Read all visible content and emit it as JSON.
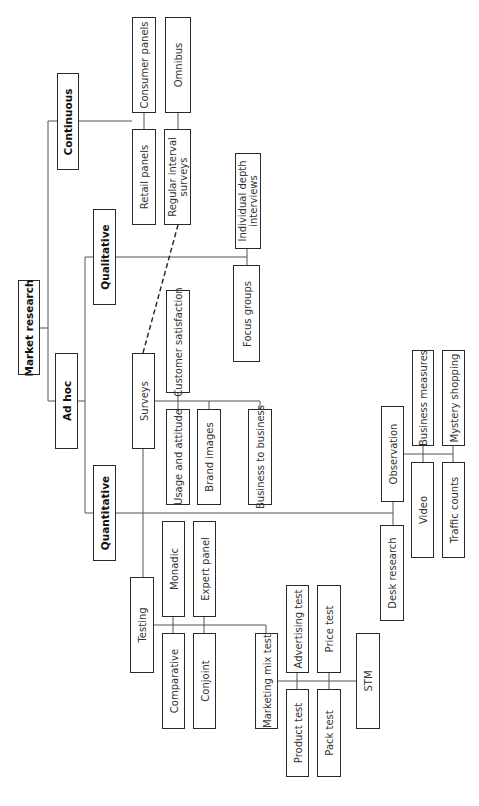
{
  "diagram": {
    "title": "Market research",
    "nodes": [
      {
        "id": "market-research",
        "label": "Market research",
        "bold": true,
        "x": 18,
        "y": 280,
        "w": 22,
        "h": 95
      },
      {
        "id": "continuous",
        "label": "Continuous",
        "bold": true,
        "x": 57,
        "y": 73,
        "w": 22,
        "h": 97
      },
      {
        "id": "ad-hoc",
        "label": "Ad hoc",
        "bold": true,
        "x": 55,
        "y": 353,
        "w": 23,
        "h": 96
      },
      {
        "id": "qualitative",
        "label": "Qualitative",
        "bold": true,
        "x": 93,
        "y": 209,
        "w": 23,
        "h": 96
      },
      {
        "id": "quantitative",
        "label": "Quantitative",
        "bold": true,
        "x": 93,
        "y": 465,
        "w": 23,
        "h": 96
      },
      {
        "id": "consumer-panels",
        "label": "Consumer panels",
        "x": 132,
        "y": 17,
        "w": 24,
        "h": 96
      },
      {
        "id": "omnibus",
        "label": "Omnibus",
        "x": 165,
        "y": 17,
        "w": 26,
        "h": 96
      },
      {
        "id": "retail-panels",
        "label": "Retail panels",
        "x": 132,
        "y": 129,
        "w": 24,
        "h": 96
      },
      {
        "id": "regular-interval-surveys",
        "label": "Regular interval\nsurveys",
        "x": 164,
        "y": 129,
        "w": 27,
        "h": 96
      },
      {
        "id": "individual-depth-interviews",
        "label": "Individual depth\ninterviews",
        "x": 235,
        "y": 153,
        "w": 26,
        "h": 96
      },
      {
        "id": "focus-groups",
        "label": "Focus groups",
        "x": 233,
        "y": 265,
        "w": 27,
        "h": 97
      },
      {
        "id": "surveys",
        "label": "Surveys",
        "x": 132,
        "y": 353,
        "w": 23,
        "h": 96
      },
      {
        "id": "customer-satisfaction",
        "label": "Customer satisfaction",
        "x": 166,
        "y": 290,
        "w": 24,
        "h": 103
      },
      {
        "id": "usage-and-attitude",
        "label": "Usage and attitude",
        "x": 166,
        "y": 409,
        "w": 24,
        "h": 96
      },
      {
        "id": "brand-images",
        "label": "Brand images",
        "x": 197,
        "y": 409,
        "w": 24,
        "h": 96
      },
      {
        "id": "business-to-business",
        "label": "Business to business",
        "x": 248,
        "y": 409,
        "w": 24,
        "h": 96
      },
      {
        "id": "observation",
        "label": "Observation",
        "x": 381,
        "y": 406,
        "w": 23,
        "h": 96
      },
      {
        "id": "business-measures",
        "label": "Business measures",
        "x": 412,
        "y": 350,
        "w": 22,
        "h": 96
      },
      {
        "id": "mystery-shopping",
        "label": "Mystery shopping",
        "x": 442,
        "y": 350,
        "w": 23,
        "h": 96
      },
      {
        "id": "video",
        "label": "Video",
        "x": 411,
        "y": 462,
        "w": 23,
        "h": 96
      },
      {
        "id": "traffic-counts",
        "label": "Traffic counts",
        "x": 442,
        "y": 462,
        "w": 23,
        "h": 96
      },
      {
        "id": "desk-research",
        "label": "Desk research",
        "x": 380,
        "y": 525,
        "w": 24,
        "h": 96
      },
      {
        "id": "monadic",
        "label": "Monadic",
        "x": 162,
        "y": 521,
        "w": 23,
        "h": 96
      },
      {
        "id": "expert-panel",
        "label": "Expert panel",
        "x": 193,
        "y": 521,
        "w": 23,
        "h": 96
      },
      {
        "id": "testing",
        "label": "Testing",
        "x": 130,
        "y": 577,
        "w": 24,
        "h": 96
      },
      {
        "id": "comparative",
        "label": "Comparative",
        "x": 162,
        "y": 633,
        "w": 23,
        "h": 96
      },
      {
        "id": "conjoint",
        "label": "Conjoint",
        "x": 193,
        "y": 633,
        "w": 23,
        "h": 96
      },
      {
        "id": "marketing-mix-test",
        "label": "Marketing mix test",
        "x": 255,
        "y": 633,
        "w": 23,
        "h": 96
      },
      {
        "id": "advertising-test",
        "label": "Advertising test",
        "x": 286,
        "y": 585,
        "w": 23,
        "h": 88
      },
      {
        "id": "price-test",
        "label": "Price test",
        "x": 317,
        "y": 585,
        "w": 24,
        "h": 88
      },
      {
        "id": "product-test",
        "label": "Product test",
        "x": 286,
        "y": 689,
        "w": 23,
        "h": 88
      },
      {
        "id": "pack-test",
        "label": "Pack test",
        "x": 317,
        "y": 689,
        "w": 24,
        "h": 88
      },
      {
        "id": "stm",
        "label": "STM",
        "x": 356,
        "y": 633,
        "w": 24,
        "h": 96
      }
    ],
    "lines": [
      {
        "pts": [
          [
            40,
            328
          ],
          [
            48,
            328
          ]
        ]
      },
      {
        "pts": [
          [
            57,
            121
          ],
          [
            48,
            121
          ],
          [
            48,
            401
          ],
          [
            55,
            401
          ]
        ]
      },
      {
        "pts": [
          [
            79,
            121
          ],
          [
            132,
            121
          ]
        ]
      },
      {
        "pts": [
          [
            144,
            113
          ],
          [
            144,
            129
          ]
        ]
      },
      {
        "pts": [
          [
            178,
            113
          ],
          [
            178,
            129
          ]
        ]
      },
      {
        "pts": [
          [
            78,
            401
          ],
          [
            85,
            401
          ]
        ]
      },
      {
        "pts": [
          [
            93,
            257
          ],
          [
            85,
            257
          ],
          [
            85,
            513
          ],
          [
            93,
            513
          ]
        ]
      },
      {
        "pts": [
          [
            116,
            257
          ],
          [
            247,
            257
          ]
        ]
      },
      {
        "pts": [
          [
            247,
            249
          ],
          [
            247,
            265
          ]
        ]
      },
      {
        "pts": [
          [
            116,
            513
          ],
          [
            393,
            513
          ]
        ]
      },
      {
        "pts": [
          [
            393,
            502
          ],
          [
            393,
            525
          ]
        ]
      },
      {
        "pts": [
          [
            404,
            454
          ],
          [
            453,
            454
          ]
        ]
      },
      {
        "pts": [
          [
            423,
            446
          ],
          [
            423,
            462
          ]
        ]
      },
      {
        "pts": [
          [
            453,
            446
          ],
          [
            453,
            462
          ]
        ]
      },
      {
        "pts": [
          [
            143,
            449
          ],
          [
            143,
            577
          ]
        ]
      },
      {
        "pts": [
          [
            155,
            401
          ],
          [
            260,
            401
          ],
          [
            260,
            409
          ]
        ]
      },
      {
        "pts": [
          [
            178,
            393
          ],
          [
            178,
            409
          ]
        ]
      },
      {
        "pts": [
          [
            209,
            401
          ],
          [
            209,
            409
          ]
        ]
      },
      {
        "pts": [
          [
            154,
            625
          ],
          [
            266,
            625
          ],
          [
            266,
            633
          ]
        ]
      },
      {
        "pts": [
          [
            173,
            617
          ],
          [
            173,
            633
          ]
        ]
      },
      {
        "pts": [
          [
            204,
            617
          ],
          [
            204,
            633
          ]
        ]
      },
      {
        "pts": [
          [
            278,
            681
          ],
          [
            356,
            681
          ]
        ]
      },
      {
        "pts": [
          [
            297,
            673
          ],
          [
            297,
            689
          ]
        ]
      },
      {
        "pts": [
          [
            329,
            673
          ],
          [
            329,
            689
          ]
        ]
      }
    ],
    "dashed_lines": [
      {
        "pts": [
          [
            143,
            353
          ],
          [
            178,
            225
          ]
        ]
      }
    ]
  }
}
